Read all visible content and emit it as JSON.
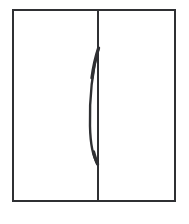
{
  "illustration": {
    "title": "Two-door cabinet front elevation",
    "alt_text": "Line drawing of a rectangular two-door cabinet with a central vertical seam and a curved bow handle",
    "background_color": "#ffffff",
    "line_color": "#2f3033",
    "frame": {
      "label": "cabinet outer frame",
      "border_width_px": 2,
      "x": 12,
      "y": 9,
      "width": 164,
      "height": 193
    },
    "divider": {
      "label": "door seam",
      "x": 97,
      "width_px": 2,
      "top": 11,
      "height": 189
    },
    "handle": {
      "label": "bow handle",
      "shape": "curved vertical bow",
      "top": 48,
      "bottom": 162,
      "max_bow_offset_px": 8,
      "color": "#2f3033"
    },
    "panels": [
      {
        "name": "left-door-panel"
      },
      {
        "name": "right-door-panel"
      }
    ]
  },
  "watermark": {
    "text": "",
    "color": "#fbfbfc"
  }
}
